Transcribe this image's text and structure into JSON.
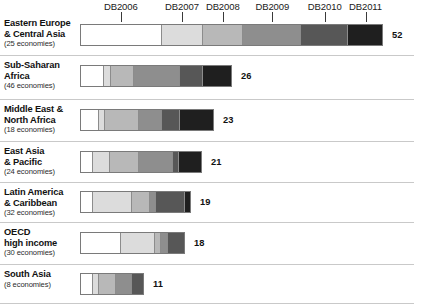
{
  "chart_data": {
    "type": "bar",
    "subtype": "horizontal-stacked",
    "title": "",
    "xlabel": "",
    "ylabel": "",
    "grid": false,
    "legend_position": "top",
    "axis_note": "Tick marks above the first bar mark the centre of each report-year segment",
    "categories": [
      "Eastern Europe & Central Asia",
      "Sub-Saharan Africa",
      "Middle East & North Africa",
      "East Asia & Pacific",
      "Latin America & Caribbean",
      "OECD high income",
      "South Asia"
    ],
    "series": [
      {
        "name": "DB2006",
        "values": [
          14,
          4,
          3,
          2,
          2,
          7,
          2
        ]
      },
      {
        "name": "DB2007",
        "values": [
          7,
          1,
          1,
          3,
          7,
          6,
          1
        ]
      },
      {
        "name": "DB2008",
        "values": [
          7,
          4,
          6,
          5,
          3,
          1,
          3
        ]
      },
      {
        "name": "DB2009",
        "values": [
          10,
          8,
          4,
          6,
          1,
          1,
          3
        ]
      },
      {
        "name": "DB2010",
        "values": [
          8,
          4,
          3,
          1,
          5,
          3,
          2
        ]
      },
      {
        "name": "DB2011",
        "values": [
          6,
          5,
          6,
          4,
          1,
          0,
          0
        ]
      }
    ],
    "totals": [
      52,
      26,
      23,
      21,
      19,
      18,
      11
    ],
    "total_labels": [
      "52",
      "26",
      "23",
      "21",
      "19",
      "18",
      "11"
    ],
    "legend": [
      "DB2006",
      "DB2007",
      "DB2008",
      "DB2009",
      "DB2010",
      "DB2011"
    ],
    "series_colors": [
      "#ffffff",
      "#dcdcdc",
      "#b8b8b8",
      "#8e8e8e",
      "#575757",
      "#1f1f1f"
    ],
    "xlim": [
      0,
      52
    ]
  },
  "axis": {
    "years": [
      {
        "label": "DB2006"
      },
      {
        "label": "DB2007"
      },
      {
        "label": "DB2008"
      },
      {
        "label": "DB2009"
      },
      {
        "label": "DB2010"
      },
      {
        "label": "DB2011"
      }
    ]
  },
  "rows": [
    {
      "name_line1": "Eastern Europe",
      "name_line2": "& Central Asia",
      "economies": "(25 economies)",
      "total": "52"
    },
    {
      "name_line1": "Sub-Saharan",
      "name_line2": "Africa",
      "economies": "(46 economies)",
      "total": "26"
    },
    {
      "name_line1": "Middle East &",
      "name_line2": "North Africa",
      "economies": "(18 economies)",
      "total": "23"
    },
    {
      "name_line1": "East Asia",
      "name_line2": "& Pacific",
      "economies": "(24 economies)",
      "total": "21"
    },
    {
      "name_line1": "Latin America",
      "name_line2": "& Caribbean",
      "economies": "(32 economies)",
      "total": "19"
    },
    {
      "name_line1": "OECD",
      "name_line2": "high income",
      "economies": "(30 economies)",
      "total": "18"
    },
    {
      "name_line1": "South Asia",
      "name_line2": "",
      "economies": "(8 economies)",
      "total": "11"
    }
  ]
}
